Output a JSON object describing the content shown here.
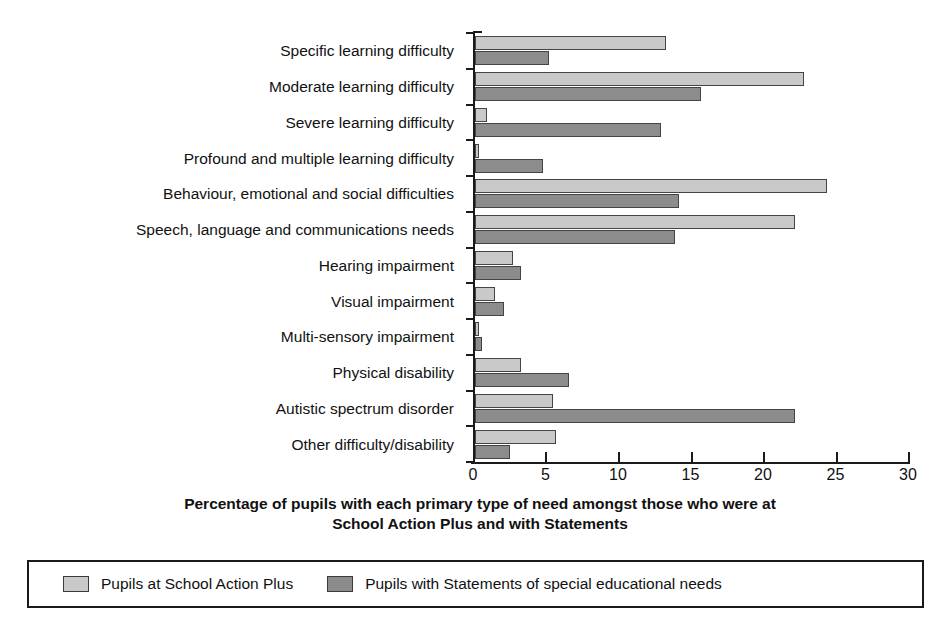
{
  "chart_data": {
    "type": "bar",
    "orientation": "horizontal",
    "title_lines": [
      "Percentage of pupils with each primary type of need amongst those who were at",
      "School Action Plus and with Statements"
    ],
    "xlabel": "",
    "ylabel": "",
    "xlim": [
      0,
      30
    ],
    "xticks": [
      0,
      5,
      10,
      15,
      20,
      25,
      30
    ],
    "xtick_labels": [
      "0",
      "5",
      "10",
      "15",
      "20",
      "25",
      "30"
    ],
    "grid": false,
    "legend_position": "bottom",
    "categories": [
      "Specific learning difficulty",
      "Moderate learning difficulty",
      "Severe learning difficulty",
      "Profound and multiple learning difficulty",
      "Behaviour, emotional and social difficulties",
      "Speech, language and communications needs",
      "Hearing impairment",
      "Visual impairment",
      "Multi-sensory impairment",
      "Physical disability",
      "Autistic spectrum disorder",
      "Other difficulty/disability"
    ],
    "series": [
      {
        "name": "Pupils at School Action Plus",
        "color": "#c9c9c9",
        "values": [
          13.2,
          22.7,
          0.8,
          0.3,
          24.3,
          22.1,
          2.6,
          1.4,
          0.3,
          3.2,
          5.4,
          5.6
        ]
      },
      {
        "name": "Pupils with Statements of special educational needs",
        "color": "#8c8c8c",
        "values": [
          5.1,
          15.6,
          12.8,
          4.7,
          14.1,
          13.8,
          3.2,
          2.0,
          0.5,
          6.5,
          22.1,
          2.4
        ]
      }
    ]
  },
  "legend": {
    "items": [
      {
        "label": "Pupils at School Action Plus",
        "swatch": "#c9c9c9"
      },
      {
        "label": "Pupils with Statements of special educational needs",
        "swatch": "#8c8c8c"
      }
    ]
  }
}
